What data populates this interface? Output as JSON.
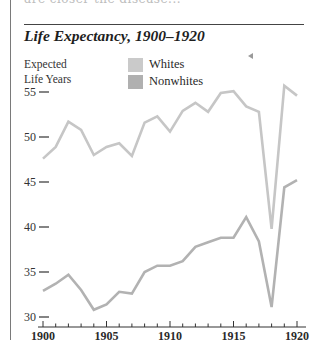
{
  "page": {
    "top_fragment": "are closer the disease...",
    "title": "Life Expectancy, 1900–1920"
  },
  "chart_data": {
    "type": "line",
    "title": "Life Expectancy, 1900–1920",
    "xlabel": "",
    "ylabel": "Expected Life Years",
    "ylabel_lines": [
      "Expected",
      "Life Years"
    ],
    "x": [
      1900,
      1901,
      1902,
      1903,
      1904,
      1905,
      1906,
      1907,
      1908,
      1909,
      1910,
      1911,
      1912,
      1913,
      1914,
      1915,
      1916,
      1917,
      1918,
      1919,
      1920
    ],
    "series": [
      {
        "name": "Whites",
        "color": "#c6c6c6",
        "values": [
          47.6,
          48.9,
          51.7,
          50.8,
          48.0,
          48.9,
          49.3,
          47.9,
          51.6,
          52.3,
          50.6,
          52.9,
          53.8,
          52.8,
          54.9,
          55.1,
          53.4,
          52.8,
          39.8,
          55.7,
          54.6
        ]
      },
      {
        "name": "Nonwhites",
        "color": "#b2b2b2",
        "values": [
          32.9,
          33.7,
          34.7,
          33.0,
          30.8,
          31.4,
          32.8,
          32.6,
          35.0,
          35.7,
          35.7,
          36.2,
          37.8,
          38.3,
          38.8,
          38.8,
          41.1,
          38.4,
          31.1,
          44.4,
          45.2
        ]
      }
    ],
    "yticks": [
      30,
      35,
      40,
      45,
      50,
      55
    ],
    "ytick_labels": [
      "30—",
      "35—",
      "40—",
      "45—",
      "50—",
      "55—"
    ],
    "xticks_major": [
      1900,
      1905,
      1910,
      1915,
      1920
    ],
    "xtick_labels": [
      "1900",
      "1905",
      "1910",
      "1915",
      "1920"
    ],
    "xlim": [
      1900,
      1920
    ],
    "ylim": [
      30,
      57
    ],
    "grid": false,
    "legend_position": "top-center"
  }
}
